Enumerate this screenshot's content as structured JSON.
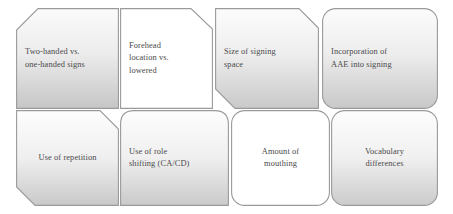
{
  "diagram": {
    "type": "process-boxes-grid",
    "background_color": "#ffffff",
    "border_color": "#9a9a9a",
    "text_color": "#4a4a4a",
    "fill_light": "#ffffff",
    "fill_gradient_top": "#fbfbfb",
    "fill_gradient_bottom": "#c9c9c9",
    "rows": 2,
    "columns": 4,
    "nodes": [
      {
        "id": "node-two-handed-vs-one-handed-signs",
        "label": "Two-handed vs.\none-handed signs",
        "row": 1,
        "column": 1,
        "shape": "bevel-top-left",
        "fill": "gradient",
        "align": "left"
      },
      {
        "id": "node-forehead-location-vs-lowered",
        "label": "Forehead\nlocation vs.\nlowered",
        "row": 1,
        "column": 2,
        "shape": "bevel-top-right",
        "fill": "white",
        "align": "left"
      },
      {
        "id": "node-size-of-signing-space",
        "label": "Size of signing\nspace",
        "row": 1,
        "column": 3,
        "shape": "bevel-top-right-bottom-left",
        "fill": "gradient",
        "align": "left"
      },
      {
        "id": "node-incorporation-of-aae-into-signing",
        "label": "Incorporation of\nAAE into signing",
        "row": 1,
        "column": 4,
        "shape": "rounded",
        "fill": "gradient",
        "align": "left"
      },
      {
        "id": "node-use-of-repetition",
        "label": "Use of repetition",
        "row": 2,
        "column": 1,
        "shape": "bevel-top-right-bottom-left",
        "fill": "gradient",
        "align": "center"
      },
      {
        "id": "node-use-of-role-shifting",
        "label": "Use of role\nshifting (CA/CD)",
        "row": 2,
        "column": 2,
        "shape": "rounded-top",
        "fill": "gradient",
        "align": "left"
      },
      {
        "id": "node-amount-of-mouthing",
        "label": "Amount of\nmouthing",
        "row": 2,
        "column": 3,
        "shape": "rounded",
        "fill": "white",
        "align": "center"
      },
      {
        "id": "node-vocabulary-differences",
        "label": "Vocabulary\ndifferences",
        "row": 2,
        "column": 4,
        "shape": "rounded",
        "fill": "gradient",
        "align": "center"
      }
    ]
  }
}
